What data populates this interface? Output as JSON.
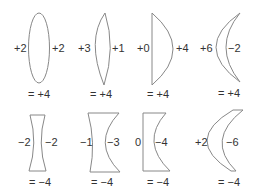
{
  "diagram": {
    "title": "",
    "stroke_color": "#888888",
    "text_color": "#333333",
    "rows": [
      {
        "name": "converging",
        "lenses": [
          {
            "type": "biconvex",
            "left": "+2",
            "right": "+2",
            "total": "= +4"
          },
          {
            "type": "asymmetric-biconvex",
            "left": "+3",
            "right": "+1",
            "total": "= +4"
          },
          {
            "type": "plano-convex",
            "left": "+0",
            "right": "+4",
            "total": "= +4"
          },
          {
            "type": "convex-meniscus",
            "left": "+6",
            "right": "−2",
            "total": "= +4"
          }
        ]
      },
      {
        "name": "diverging",
        "lenses": [
          {
            "type": "biconcave",
            "left": "−2",
            "right": "−2",
            "total": "= −4"
          },
          {
            "type": "asymmetric-biconcave",
            "left": "−1",
            "right": "−3",
            "total": "= −4"
          },
          {
            "type": "plano-concave",
            "left": "0",
            "right": "−4",
            "total": "= −4"
          },
          {
            "type": "concave-meniscus",
            "left": "+2",
            "right": "−6",
            "total": "= −4"
          }
        ]
      }
    ]
  }
}
